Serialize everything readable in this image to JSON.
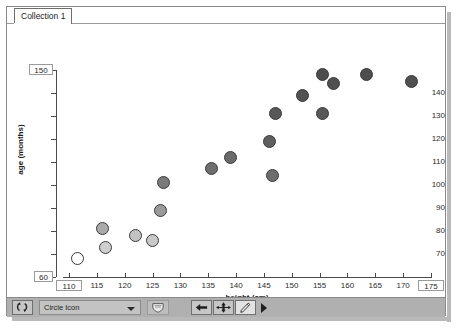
{
  "window": {
    "tab_label": "Collection 1"
  },
  "chart_data": {
    "type": "scatter",
    "title": "",
    "xlabel": "height  (cm)",
    "ylabel": "age (months)",
    "xlim": [
      110,
      175
    ],
    "ylim": [
      60,
      150
    ],
    "xticks": [
      110,
      115,
      120,
      125,
      130,
      135,
      140,
      145,
      150,
      155,
      160,
      165,
      170,
      175
    ],
    "yticks": [
      60,
      70,
      80,
      90,
      100,
      110,
      120,
      130,
      140,
      150
    ],
    "x_bound_min_label": "110",
    "x_bound_max_label": "175",
    "y_bound_min_label": "60",
    "y_bound_max_label": "150",
    "grid": false,
    "legend": "none",
    "marker": "circle",
    "points": [
      {
        "x": 111.5,
        "y": 68,
        "fill": "#ffffff"
      },
      {
        "x": 116.5,
        "y": 73,
        "fill": "#cfcfcf"
      },
      {
        "x": 116.0,
        "y": 81,
        "fill": "#aaaaaa"
      },
      {
        "x": 122.0,
        "y": 78,
        "fill": "#c2c2c2"
      },
      {
        "x": 125.0,
        "y": 76,
        "fill": "#c8c8c8"
      },
      {
        "x": 126.5,
        "y": 89,
        "fill": "#9a9a9a"
      },
      {
        "x": 127.0,
        "y": 101,
        "fill": "#7a7a7a"
      },
      {
        "x": 135.5,
        "y": 107,
        "fill": "#6e6e6e"
      },
      {
        "x": 139.0,
        "y": 112,
        "fill": "#6a6a6a"
      },
      {
        "x": 146.5,
        "y": 104,
        "fill": "#6e6e6e"
      },
      {
        "x": 146.0,
        "y": 119,
        "fill": "#5f5f5f"
      },
      {
        "x": 147.0,
        "y": 131,
        "fill": "#585858"
      },
      {
        "x": 152.0,
        "y": 139,
        "fill": "#525252"
      },
      {
        "x": 155.5,
        "y": 131,
        "fill": "#585858"
      },
      {
        "x": 155.5,
        "y": 148,
        "fill": "#4d4d4d"
      },
      {
        "x": 157.5,
        "y": 144,
        "fill": "#4f4f4f"
      },
      {
        "x": 163.5,
        "y": 148,
        "fill": "#4d4d4d"
      },
      {
        "x": 171.5,
        "y": 145,
        "fill": "#505050"
      }
    ]
  },
  "toolbar": {
    "swap_icon_name": "swap-arrows-icon",
    "icon_select_value": "Circle Icon",
    "shield_icon_name": "shield-icon",
    "back_icon_name": "arrow-left-icon",
    "move_icon_name": "move-crosshair-icon",
    "pencil_icon_name": "pencil-icon",
    "next_icon_name": "play-next-icon"
  }
}
